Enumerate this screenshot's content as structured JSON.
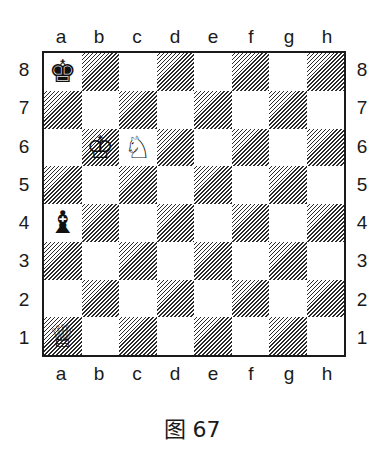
{
  "diagram": {
    "caption": "图 67",
    "files": [
      "a",
      "b",
      "c",
      "d",
      "e",
      "f",
      "g",
      "h"
    ],
    "ranks": [
      "8",
      "7",
      "6",
      "5",
      "4",
      "3",
      "2",
      "1"
    ],
    "pieces": [
      {
        "square": "a8",
        "color": "black",
        "type": "king",
        "glyph": "♚"
      },
      {
        "square": "b6",
        "color": "white",
        "type": "king",
        "glyph": "♔"
      },
      {
        "square": "c6",
        "color": "white",
        "type": "knight",
        "glyph": "♘"
      },
      {
        "square": "a4",
        "color": "black",
        "type": "bishop",
        "glyph": "♝"
      },
      {
        "square": "a1",
        "color": "white",
        "type": "queen",
        "glyph": "♕"
      }
    ],
    "colors": {
      "line": "#1a1a1a",
      "light_square": "#ffffff",
      "dark_square_hatch": "#2a2a2a"
    }
  }
}
